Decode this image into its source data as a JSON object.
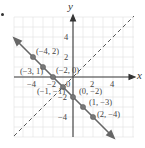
{
  "graph": {
    "x_axis_label": "x",
    "y_axis_label": "y",
    "x_ticks": [
      {
        "value": -4,
        "label": "−4"
      },
      {
        "value": -2,
        "label": "−2"
      },
      {
        "value": 0,
        "label": "0"
      },
      {
        "value": 2,
        "label": "2"
      },
      {
        "value": 4,
        "label": "4"
      }
    ],
    "y_ticks": [
      {
        "value": 4,
        "label": "4"
      },
      {
        "value": 2,
        "label": "2"
      },
      {
        "value": -2,
        "label": "−2"
      },
      {
        "value": -4,
        "label": "−4"
      }
    ],
    "points": [
      {
        "x": -4,
        "y": 2,
        "label": "(−4, 2)"
      },
      {
        "x": -3,
        "y": 1,
        "label": "(−3, 1)"
      },
      {
        "x": -2,
        "y": 0,
        "label": "(−2, 0)"
      },
      {
        "x": -1,
        "y": -1,
        "label": "(−1, −1)"
      },
      {
        "x": 0,
        "y": -2,
        "label": "(0, −2)"
      },
      {
        "x": 1,
        "y": -3,
        "label": "(1, −3)"
      },
      {
        "x": 2,
        "y": -4,
        "label": "(2, −4)"
      }
    ],
    "solid_line": "y = −x − 2",
    "dashed_line": "y = x",
    "colors": {
      "solid_line": "#666666",
      "dashed_line": "#555555",
      "points": "#777777",
      "grid": "#dddddd",
      "axes": "#333333"
    }
  }
}
